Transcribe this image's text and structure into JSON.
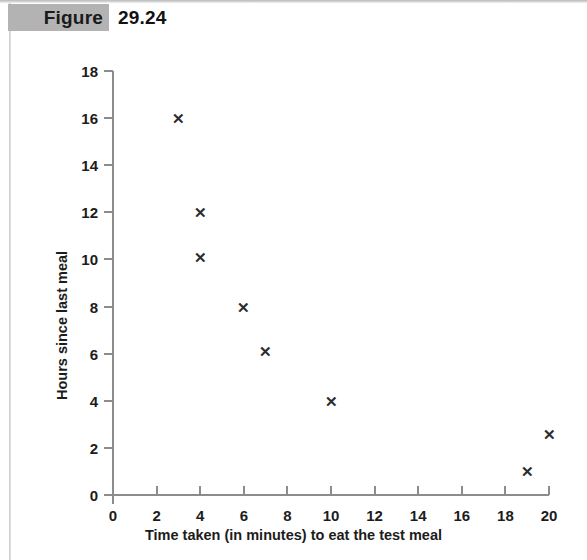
{
  "figure": {
    "label": "Figure",
    "number": "29.24"
  },
  "chart_data": {
    "type": "scatter",
    "title": "",
    "xlabel": "Time taken (in minutes) to eat the test meal",
    "ylabel": "Hours since last meal",
    "xlim": [
      0,
      20
    ],
    "ylim": [
      0,
      18
    ],
    "xticks": [
      0,
      2,
      4,
      6,
      8,
      10,
      12,
      14,
      16,
      18,
      20
    ],
    "yticks": [
      0,
      2,
      4,
      6,
      8,
      10,
      12,
      14,
      16,
      18
    ],
    "xtick_labels": [
      "0",
      "2",
      "4",
      "6",
      "8",
      "10",
      "12",
      "14",
      "16",
      "18",
      "20"
    ],
    "ytick_labels": [
      "0",
      "2",
      "4",
      "6",
      "8",
      "10",
      "12",
      "14",
      "16",
      "18"
    ],
    "grid": false,
    "legend": null,
    "marker": "x",
    "marker_color": "#2b2b2b",
    "points": [
      {
        "x": 3,
        "y": 16
      },
      {
        "x": 4,
        "y": 12
      },
      {
        "x": 4,
        "y": 10.1
      },
      {
        "x": 6,
        "y": 8
      },
      {
        "x": 7,
        "y": 6.1
      },
      {
        "x": 10,
        "y": 4
      },
      {
        "x": 19,
        "y": 1
      },
      {
        "x": 20,
        "y": 2.6
      }
    ]
  },
  "colors": {
    "header_band": "#b3b3b3",
    "axis": "#8c8c8c",
    "text": "#1c1c1c"
  }
}
